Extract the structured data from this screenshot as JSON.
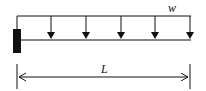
{
  "diagram": {
    "load_label": "w",
    "length_label": "L",
    "load_arrows": 5,
    "colors": {
      "stroke": "#111111",
      "background": "#ffffff"
    }
  }
}
